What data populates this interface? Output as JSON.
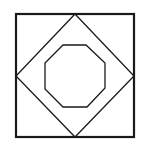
{
  "diagram": {
    "background": "#ffffff",
    "stroke_color": "#1a1a1a",
    "shapes": {
      "outer_square": {
        "x": 16,
        "y": 14,
        "width": 118,
        "height": 123,
        "stroke_width": 2.2
      },
      "diamond": {
        "points": "75,14 134,76 75,137 16,76",
        "stroke_width": 1.3
      },
      "octagon": {
        "points": "63,45 86,45 105,63 105,88 87,107 63,107 45,89 45,63",
        "stroke_width": 1.3
      }
    }
  }
}
